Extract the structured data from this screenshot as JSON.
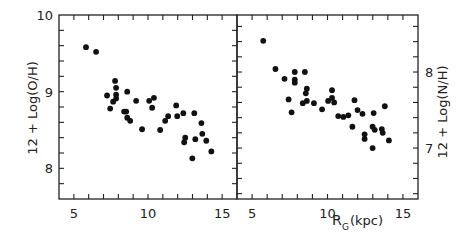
{
  "chart_data": [
    {
      "type": "scatter",
      "panel": "left",
      "title": "",
      "xlabel": "",
      "ylabel": "12 + Log(O/H)",
      "xlim": [
        4,
        16
      ],
      "ylim": [
        7.6,
        10.0
      ],
      "x_ticks": [
        5,
        10,
        15
      ],
      "y_ticks": [
        8,
        9,
        10
      ],
      "y_minor_step": 0.2,
      "x_minor_step": 1,
      "y_axis_side": "left",
      "grid": false,
      "series": [
        {
          "name": "O/H",
          "x": [
            5.82,
            6.5,
            7.24,
            7.45,
            7.78,
            7.85,
            7.85,
            7.85,
            7.65,
            8.6,
            8.39,
            8.53,
            8.6,
            8.8,
            9.2,
            9.6,
            10.08,
            10.4,
            10.28,
            10.82,
            11.16,
            11.36,
            11.9,
            11.97,
            12.38,
            12.44,
            12.51,
            13.12,
            13.19,
            12.99,
            13.6,
            13.66,
            13.93,
            14.27
          ],
          "y": [
            9.58,
            9.52,
            8.95,
            8.78,
            9.14,
            9.05,
            8.96,
            8.91,
            8.87,
            9.0,
            8.74,
            8.74,
            8.66,
            8.62,
            8.88,
            8.51,
            8.88,
            8.92,
            8.79,
            8.5,
            8.62,
            8.68,
            8.82,
            8.68,
            8.72,
            8.34,
            8.4,
            8.72,
            8.38,
            8.13,
            8.59,
            8.45,
            8.36,
            8.22
          ]
        }
      ]
    },
    {
      "type": "scatter",
      "panel": "right",
      "title": "",
      "xlabel_main": "R",
      "xlabel_sub": "G",
      "xlabel_unit": "(kpc)",
      "ylabel": "12 + Log(N/H)",
      "xlim": [
        4,
        16
      ],
      "ylim": [
        6.33,
        8.75
      ],
      "x_ticks": [
        5,
        10,
        15
      ],
      "y_ticks": [
        7,
        8
      ],
      "y_minor_step": 0.2,
      "x_minor_step": 1,
      "y_axis_side": "right",
      "grid": false,
      "series": [
        {
          "name": "N/H",
          "x": [
            5.74,
            6.55,
            7.15,
            7.83,
            7.83,
            7.83,
            8.5,
            8.63,
            8.56,
            7.42,
            7.62,
            8.36,
            8.63,
            9.1,
            9.64,
            10.04,
            10.3,
            10.3,
            10.44,
            10.71,
            11.05,
            11.38,
            11.65,
            11.79,
            11.99,
            12.32,
            12.46,
            12.46,
            13.06,
            12.99,
            13.13,
            12.99,
            13.8,
            13.6,
            13.66,
            14.07
          ],
          "y": [
            8.41,
            8.04,
            7.91,
            8.0,
            7.9,
            7.86,
            8.0,
            7.78,
            7.72,
            7.64,
            7.47,
            7.59,
            7.62,
            7.59,
            7.51,
            7.62,
            7.76,
            7.66,
            7.6,
            7.42,
            7.41,
            7.43,
            7.28,
            7.63,
            7.5,
            7.45,
            7.18,
            7.12,
            7.46,
            7.28,
            7.24,
            7.0,
            7.55,
            7.25,
            7.2,
            7.1
          ]
        }
      ]
    }
  ],
  "labels": {
    "left_ylabel": "12 + Log(O/H)",
    "right_ylabel": "12 + Log(N/H)",
    "xlabel_main": "R",
    "xlabel_sub": "G",
    "xlabel_unit": "(kpc)"
  }
}
